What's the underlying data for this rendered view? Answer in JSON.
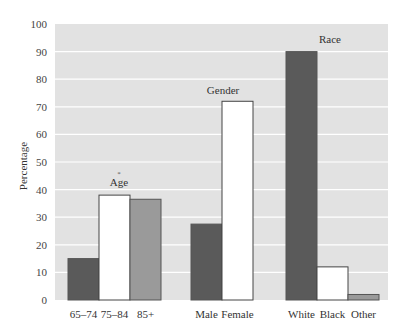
{
  "chart_data": {
    "type": "bar",
    "title": "",
    "xlabel": "",
    "ylabel": "Percentage",
    "ylim": [
      0,
      100
    ],
    "yticks": [
      0,
      10,
      20,
      30,
      40,
      50,
      60,
      70,
      80,
      90,
      100
    ],
    "grid": true,
    "legend": "none",
    "groups": [
      {
        "name": "Age",
        "categories": [
          "65–74",
          "75–84",
          "85+"
        ],
        "values": [
          15,
          38,
          36.5
        ],
        "fills": [
          "#5a5a5a",
          "#ffffff",
          "#9a9a9a"
        ]
      },
      {
        "name": "Gender",
        "categories": [
          "Male",
          "Female"
        ],
        "values": [
          27.5,
          72
        ],
        "fills": [
          "#5a5a5a",
          "#ffffff"
        ]
      },
      {
        "name": "Race",
        "categories": [
          "White",
          "Black",
          "Other"
        ],
        "values": [
          90,
          12,
          2
        ],
        "fills": [
          "#5a5a5a",
          "#ffffff",
          "#9a9a9a"
        ]
      }
    ],
    "annotations": [
      "*"
    ]
  },
  "colors": {
    "plot_background": "#e2e2e2",
    "gridline": "#ffffff",
    "bar_outline": "#555555"
  }
}
